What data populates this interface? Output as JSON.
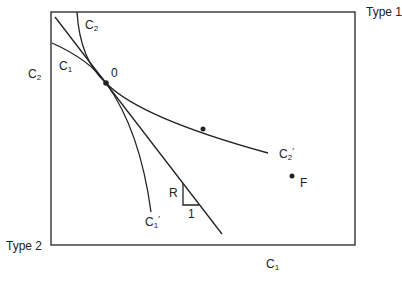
{
  "diagram": {
    "type": "edgeworth-box",
    "corners": {
      "top_right": "Type 1",
      "bottom_left": "Type 2"
    },
    "axis_labels": {
      "left": {
        "base": "C",
        "sub": "2"
      },
      "bottom": {
        "base": "C",
        "sub": "1"
      }
    },
    "curves": [
      {
        "id": "C1",
        "start_label": {
          "base": "C",
          "sub": "1"
        },
        "end_label": {
          "base": "C",
          "sub": "1",
          "prime": "′"
        }
      },
      {
        "id": "C2",
        "start_label": {
          "base": "C",
          "sub": "2"
        },
        "end_label": {
          "base": "C",
          "sub": "2",
          "prime": "′"
        }
      }
    ],
    "tangent_point_label": "0",
    "point_F_label": "F",
    "slope_triangle": {
      "vertical_label": "R",
      "horizontal_label": "1"
    },
    "colors": {
      "line": "#222222",
      "background": "#ffffff"
    }
  }
}
